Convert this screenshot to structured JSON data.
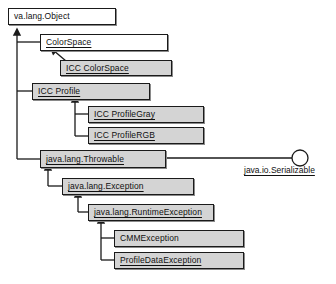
{
  "diagram": {
    "kind": "uml-class-hierarchy",
    "colors": {
      "line": "#1a1a1a",
      "box_fill_abstract": "#ffffff",
      "box_fill_concrete": "#d4d4d4",
      "box_border": "#1a1a1a",
      "box_shadow": "#8a8a8a",
      "text": "#101010",
      "background": "#ffffff"
    },
    "nodes": [
      {
        "id": "object",
        "label": "va.lang.Object",
        "fill": "white",
        "underline": false,
        "x": 8,
        "y": 8,
        "w": 108,
        "h": 17
      },
      {
        "id": "colorspace",
        "label": "ColorSpace",
        "fill": "white",
        "underline": true,
        "x": 40,
        "y": 34,
        "w": 128,
        "h": 17
      },
      {
        "id": "icc-colorspace",
        "label": "ICC ColorSpace",
        "fill": "gray",
        "underline": true,
        "x": 60,
        "y": 60,
        "w": 112,
        "h": 16
      },
      {
        "id": "icc-profile",
        "label": "ICC Profile",
        "fill": "gray",
        "underline": true,
        "x": 32,
        "y": 83,
        "w": 118,
        "h": 17
      },
      {
        "id": "icc-profilegray",
        "label": "ICC ProfileGray",
        "fill": "gray",
        "underline": true,
        "x": 88,
        "y": 106,
        "w": 116,
        "h": 17
      },
      {
        "id": "icc-profilergb",
        "label": "ICC ProfileRGB",
        "fill": "gray",
        "underline": true,
        "x": 88,
        "y": 127,
        "w": 116,
        "h": 17
      },
      {
        "id": "throwable",
        "label": "java.lang.Throwable",
        "fill": "gray",
        "underline": true,
        "x": 40,
        "y": 150,
        "w": 126,
        "h": 18
      },
      {
        "id": "exception",
        "label": "java.lang.Exception",
        "fill": "gray",
        "underline": true,
        "x": 62,
        "y": 178,
        "w": 132,
        "h": 17
      },
      {
        "id": "runtimeexception",
        "label": "java.lang.RuntimeException",
        "fill": "gray",
        "underline": true,
        "x": 88,
        "y": 204,
        "w": 126,
        "h": 17
      },
      {
        "id": "cmmexception",
        "label": "CMMException",
        "fill": "gray",
        "underline": false,
        "x": 114,
        "y": 230,
        "w": 130,
        "h": 17
      },
      {
        "id": "profiledataexception",
        "label": "ProfileDataException",
        "fill": "gray",
        "underline": true,
        "x": 114,
        "y": 252,
        "w": 130,
        "h": 17
      }
    ],
    "interface": {
      "label": "java.io.Serializable",
      "circle": {
        "cx": 300,
        "cy": 158,
        "r": 8
      },
      "label_x": 244,
      "label_y": 170,
      "line_from_x": 166,
      "line_to_x": 292,
      "line_y": 158
    },
    "generalizations": [
      {
        "child": "colorspace",
        "parent": "object",
        "style": "elbow-left",
        "trunk_x": 17
      },
      {
        "child": "icc-profile",
        "parent": "object",
        "style": "elbow-left",
        "trunk_x": 17
      },
      {
        "child": "throwable",
        "parent": "object",
        "style": "elbow-left",
        "trunk_x": 17
      },
      {
        "child": "icc-colorspace",
        "parent": "colorspace",
        "style": "diagonal"
      },
      {
        "child": "icc-profilegray",
        "parent": "icc-profile",
        "style": "elbow-down",
        "trunk_x": 75
      },
      {
        "child": "icc-profilergb",
        "parent": "icc-profile",
        "style": "elbow-down",
        "trunk_x": 75
      },
      {
        "child": "exception",
        "parent": "throwable",
        "style": "elbow-down",
        "trunk_x": 48
      },
      {
        "child": "runtimeexception",
        "parent": "exception",
        "style": "elbow-down",
        "trunk_x": 78
      },
      {
        "child": "cmmexception",
        "parent": "runtimeexception",
        "style": "elbow-down",
        "trunk_x": 101
      },
      {
        "child": "profiledataexception",
        "parent": "runtimeexception",
        "style": "elbow-down",
        "trunk_x": 101
      }
    ]
  }
}
